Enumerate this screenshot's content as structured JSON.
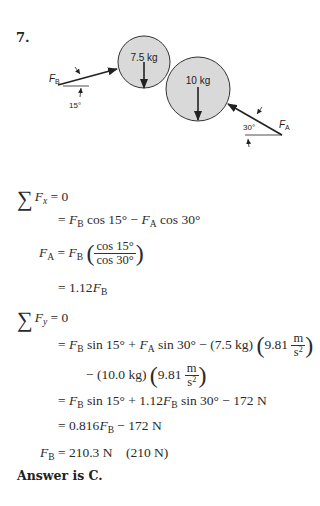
{
  "problem": {
    "number": "7.",
    "diagram": {
      "mass_small_label": "7.5 kg",
      "mass_large_label": "10 kg",
      "force_b_label": "F",
      "force_b_sub": "B",
      "force_a_label": "F",
      "force_a_sub": "A",
      "angle_b_label": "15°",
      "angle_a_label": "30°",
      "fill_color": "#d9d9d9",
      "stroke_color": "#333333"
    },
    "equations": {
      "sum_fx": {
        "sigma": "∑",
        "var": "F",
        "sub": "x",
        "rest": " = 0"
      },
      "line2": {
        "prefix": "= ",
        "a": "F",
        "a_sub": "B",
        "mid": " cos 15° − ",
        "b": "F",
        "b_sub": "A",
        "end": " cos 30°"
      },
      "line3": {
        "lhs": "F",
        "lhs_sub": "A",
        "eq": " = ",
        "rhs": "F",
        "rhs_sub": "B",
        "num": "cos 15°",
        "den": "cos 30°"
      },
      "line4": {
        "prefix": "= 1.12",
        "var": "F",
        "sub": "B"
      },
      "sum_fy": {
        "sigma": "∑",
        "var": "F",
        "sub": "y",
        "rest": " = 0"
      },
      "line6": {
        "prefix": "= ",
        "a": "F",
        "a_sub": "B",
        "mid": " sin 15° + ",
        "b": "F",
        "b_sub": "A",
        "end": " sin 30° − (7.5 kg) ",
        "g": "9.81",
        "unit_num": "m",
        "unit_den": "s",
        "unit_pow": "2"
      },
      "line7": {
        "prefix": "− (10.0 kg) ",
        "g": "9.81",
        "unit_num": "m",
        "unit_den": "s",
        "unit_pow": "2"
      },
      "line8": {
        "prefix": "= ",
        "a": "F",
        "a_sub": "B",
        "mid": " sin 15° + 1.12",
        "b": "F",
        "b_sub": "B",
        "end": " sin 30° − 172 N"
      },
      "line9": {
        "prefix": "= 0.816",
        "var": "F",
        "sub": "B",
        "end": " − 172 N"
      },
      "line10": {
        "var": "F",
        "sub": "B",
        "end": " = 210.3 N    (210 N)"
      }
    },
    "answer": "Answer is C."
  }
}
